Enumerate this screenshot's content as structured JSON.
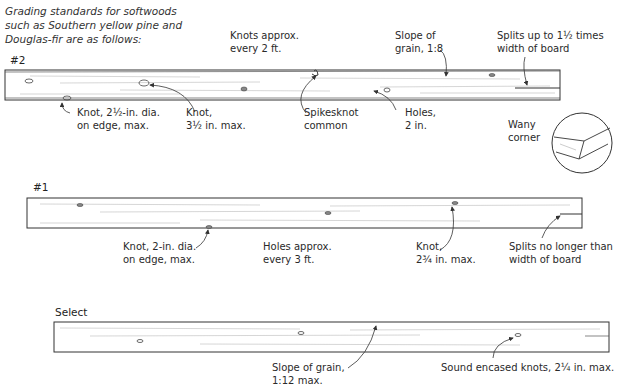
{
  "intro": {
    "line1": "Grading standards for softwoods",
    "line2": "such as Southern yellow pine and",
    "line3": "Douglas-fir are as follows:"
  },
  "boards": [
    {
      "grade": "#2",
      "labels": {
        "knots_spacing": [
          "Knots approx.",
          "every 2 ft."
        ],
        "slope": [
          "Slope of",
          "grain, 1:8"
        ],
        "splits": [
          "Splits up to 1½ times",
          "width of board"
        ],
        "edge_knot": [
          "Knot, 2½-in. dia.",
          "on edge, max."
        ],
        "knot": [
          "Knot,",
          "3½ in. max."
        ],
        "spikesknot": [
          "Spikesknot",
          "common"
        ],
        "holes": [
          "Holes,",
          "2 in."
        ],
        "wany": [
          "Wany",
          "corner"
        ]
      }
    },
    {
      "grade": "#1",
      "labels": {
        "edge_knot": [
          "Knot, 2-in. dia.",
          "on edge, max."
        ],
        "holes": [
          "Holes approx.",
          "every 3 ft."
        ],
        "knot": [
          "Knot,",
          "2¾ in. max."
        ],
        "splits": [
          "Splits no longer than",
          "width of board"
        ]
      }
    },
    {
      "grade": "Select",
      "labels": {
        "slope": [
          "Slope of grain,",
          "1:12 max."
        ],
        "knots": [
          "Sound encased knots, 2¼ in. max."
        ]
      }
    }
  ]
}
